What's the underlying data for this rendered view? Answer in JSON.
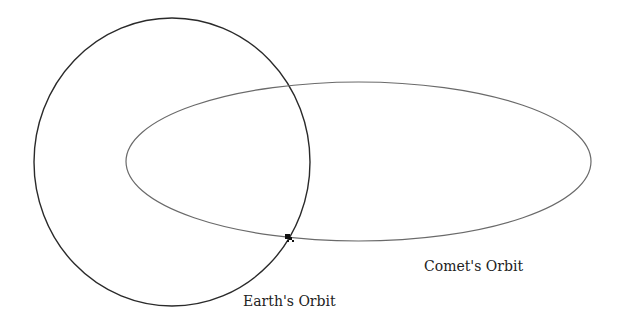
{
  "diagram": {
    "earth_orbit": {
      "label": "Earth's Orbit",
      "cx": 172,
      "cy": 162,
      "rx": 138,
      "ry": 144,
      "stroke": "#2a2a2a"
    },
    "comet_orbit": {
      "label": "Comet's Orbit",
      "cx": 358.5,
      "cy": 161.5,
      "rx": 232.5,
      "ry": 79.5,
      "stroke": "#6a6a6a"
    },
    "intersection_marker": {
      "x": 289,
      "y": 238,
      "description": "comet at orbit intersection"
    }
  }
}
